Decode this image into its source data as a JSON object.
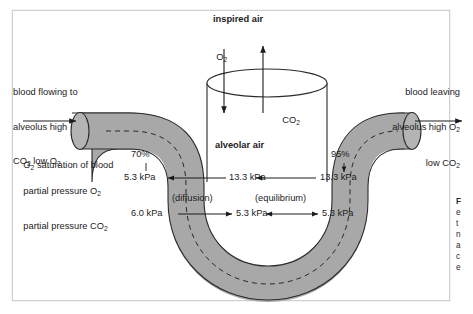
{
  "figure": {
    "title_top": "inspired air",
    "alveolus_label": "alveolar air",
    "gas_in": "O",
    "gas_in_sub": "2",
    "gas_out": "CO",
    "gas_out_sub": "2",
    "blood_in_line1": "blood flowing to",
    "blood_in_line2": "alveolus high",
    "blood_in_line3a": "CO",
    "blood_in_line3b": "2",
    "blood_in_line3c": " low O",
    "blood_in_line3d": "2",
    "blood_out_line1": "blood leaving",
    "blood_out_line2a": "alveolus high O",
    "blood_out_line2b": "2",
    "blood_out_line3a": "low CO",
    "blood_out_line3b": "2"
  },
  "row_labels": {
    "saturation_a": "O",
    "saturation_b": "2",
    "saturation_c": " saturation of blood",
    "po2_a": "partial pressure O",
    "po2_b": "2",
    "pco2_a": "partial pressure CO",
    "pco2_b": "2"
  },
  "values": {
    "sat_left": "70%",
    "sat_right": "95%",
    "po2_blood_left": "5.3 kPa",
    "po2_alveolar_left": "13.3 kPa",
    "po2_alveolar_right": "13.3 kPa",
    "po2_blood_right": "13.3 kPa",
    "pco2_blood_left": "6.0 kPa",
    "pco2_alveolar_mid": "5.3 kPa",
    "pco2_alveolar_right": "5.3 kPa",
    "pco2_blood_right": "5.3 kPa",
    "note_diffusion": "(diffusion)",
    "note_equilibrium": "(equilibrium)"
  },
  "caption": {
    "title": "F",
    "line1": "e",
    "line2": "t",
    "line3": "n",
    "line4": "a",
    "line5": "c",
    "line6": "e"
  },
  "colors": {
    "vessel_fill": "#a8a8a8",
    "vessel_stroke": "#2b2b2b",
    "line": "#1c1c1c",
    "frame": "#cfcfcf",
    "text": "#1c1c1c"
  }
}
